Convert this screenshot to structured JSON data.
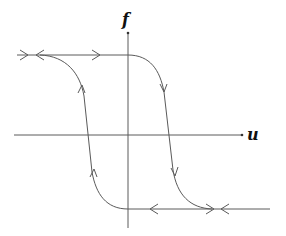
{
  "diagram": {
    "type": "hysteresis-loop",
    "axes": {
      "x_label": "u",
      "y_label": "f"
    },
    "branches": [
      {
        "name": "upper-saturation",
        "direction": "left-to-right then descending"
      },
      {
        "name": "lower-saturation",
        "direction": "right-to-left then ascending"
      }
    ],
    "colors": {
      "line": "#5a5a5a",
      "label": "#111111",
      "background": "#ffffff"
    }
  }
}
